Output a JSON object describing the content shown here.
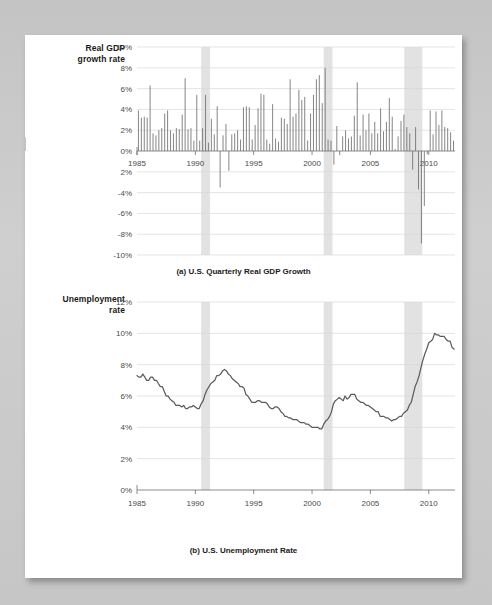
{
  "page": {
    "background_color": "#c9c9c9",
    "card_color": "#ffffff"
  },
  "figure_a": {
    "y_axis_label_line1": "Real GDP",
    "y_axis_label_line2": "growth rate",
    "caption": "(a) U.S. Quarterly Real GDP Growth"
  },
  "figure_b": {
    "y_axis_label_line1": "Unemployment",
    "y_axis_label_line2": "rate",
    "caption": "(b) U.S. Unemployment Rate"
  },
  "chart_data": [
    {
      "type": "bar",
      "title": "(a) U.S. Quarterly Real GDP Growth",
      "xlabel": "",
      "ylabel": "Real GDP growth rate",
      "xlim": [
        1985.0,
        2012.25
      ],
      "ylim": [
        -10,
        10
      ],
      "grid": true,
      "legend": "none",
      "bar_color": "#6f6f6f",
      "recession_band_color": "#e2e2e2",
      "y_ticks": [
        10,
        8,
        6,
        4,
        2,
        0,
        -2,
        -4,
        -6,
        -8,
        -10
      ],
      "y_tick_labels": [
        "10%",
        "8%",
        "6%",
        "4%",
        "2%",
        "0%",
        "2%",
        "-4%",
        "-6%",
        "-8%",
        "-10%"
      ],
      "x_ticks": [
        1985,
        1990,
        1995,
        2000,
        2005,
        2010
      ],
      "x_tick_labels": [
        "1985",
        "1990",
        "1995",
        "2000",
        "2005",
        "2010"
      ],
      "recessions": [
        {
          "start": 1990.5,
          "end": 1991.25
        },
        {
          "start": 2001.0,
          "end": 2001.75
        },
        {
          "start": 2007.9,
          "end": 2009.45
        }
      ],
      "x": [
        1985.0,
        1985.25,
        1985.5,
        1985.75,
        1986.0,
        1986.25,
        1986.5,
        1986.75,
        1987.0,
        1987.25,
        1987.5,
        1987.75,
        1988.0,
        1988.25,
        1988.5,
        1988.75,
        1989.0,
        1989.25,
        1989.5,
        1989.75,
        1990.0,
        1990.25,
        1990.5,
        1990.75,
        1991.0,
        1991.25,
        1991.5,
        1991.75,
        1992.0,
        1992.25,
        1992.5,
        1992.75,
        1993.0,
        1993.25,
        1993.5,
        1993.75,
        1994.0,
        1994.25,
        1994.5,
        1994.75,
        1995.0,
        1995.25,
        1995.5,
        1995.75,
        1996.0,
        1996.25,
        1996.5,
        1996.75,
        1997.0,
        1997.25,
        1997.5,
        1997.75,
        1998.0,
        1998.25,
        1998.5,
        1998.75,
        1999.0,
        1999.25,
        1999.5,
        1999.75,
        2000.0,
        2000.25,
        2000.5,
        2000.75,
        2001.0,
        2001.25,
        2001.5,
        2001.75,
        2002.0,
        2002.25,
        2002.5,
        2002.75,
        2003.0,
        2003.25,
        2003.5,
        2003.75,
        2004.0,
        2004.25,
        2004.5,
        2004.75,
        2005.0,
        2005.25,
        2005.5,
        2005.75,
        2006.0,
        2006.25,
        2006.5,
        2006.75,
        2007.0,
        2007.25,
        2007.5,
        2007.75,
        2008.0,
        2008.25,
        2008.5,
        2008.75,
        2009.0,
        2009.25,
        2009.5,
        2009.75,
        2010.0,
        2010.25,
        2010.5,
        2010.75,
        2011.0,
        2011.25,
        2011.5,
        2011.75,
        2012.0
      ],
      "values": [
        3.9,
        3.2,
        3.3,
        3.2,
        6.3,
        1.7,
        1.5,
        2.0,
        2.2,
        3.6,
        3.9,
        2.0,
        1.7,
        2.2,
        2.1,
        3.5,
        7.0,
        2.1,
        2.2,
        1.0,
        5.4,
        1.0,
        2.2,
        5.4,
        0.8,
        3.1,
        1.6,
        4.3,
        -3.5,
        1.5,
        2.6,
        -1.9,
        1.6,
        1.7,
        2.0,
        1.1,
        4.2,
        4.3,
        4.2,
        1.1,
        2.5,
        4.1,
        5.5,
        5.4,
        1.1,
        0.7,
        4.5,
        1.2,
        0.9,
        3.2,
        3.1,
        2.6,
        6.9,
        3.3,
        3.6,
        5.9,
        4.9,
        5.2,
        1.0,
        3.6,
        5.4,
        6.9,
        7.3,
        4.6,
        8.0,
        1.1,
        1.0,
        -1.3,
        2.4,
        -0.4,
        1.4,
        2.0,
        1.2,
        1.4,
        3.4,
        6.6,
        1.5,
        3.5,
        2.0,
        3.6,
        1.7,
        2.8,
        1.7,
        4.1,
        1.9,
        2.8,
        5.1,
        3.3,
        0.2,
        1.4,
        2.9,
        3.5,
        2.3,
        1.7,
        -1.8,
        2.3,
        -3.7,
        -8.9,
        -5.3,
        -0.3,
        3.9,
        1.6,
        3.8,
        2.5,
        3.9,
        2.3,
        2.2,
        1.8,
        1.0,
        1.3
      ]
    },
    {
      "type": "line",
      "title": "(b) U.S. Unemployment Rate",
      "xlabel": "",
      "ylabel": "Unemployment rate",
      "xlim": [
        1985.0,
        2012.25
      ],
      "ylim": [
        0,
        12
      ],
      "grid": true,
      "legend": "none",
      "line_color": "#5c5c5c",
      "recession_band_color": "#e2e2e2",
      "y_ticks": [
        12,
        10,
        8,
        6,
        4,
        2,
        0
      ],
      "y_tick_labels": [
        "12%",
        "10%",
        "8%",
        "6%",
        "4%",
        "2%",
        "0%"
      ],
      "x_ticks": [
        1985,
        1990,
        1995,
        2000,
        2005,
        2010
      ],
      "x_tick_labels": [
        "1985",
        "1990",
        "1995",
        "2000",
        "2005",
        "2010"
      ],
      "recessions": [
        {
          "start": 1990.5,
          "end": 1991.25
        },
        {
          "start": 2001.0,
          "end": 2001.75
        },
        {
          "start": 2007.9,
          "end": 2009.45
        }
      ],
      "x": [
        1985.0,
        1985.17,
        1985.33,
        1985.5,
        1985.67,
        1985.83,
        1986.0,
        1986.17,
        1986.33,
        1986.5,
        1986.67,
        1986.83,
        1987.0,
        1987.17,
        1987.33,
        1987.5,
        1987.67,
        1987.83,
        1988.0,
        1988.17,
        1988.33,
        1988.5,
        1988.67,
        1988.83,
        1989.0,
        1989.17,
        1989.33,
        1989.5,
        1989.67,
        1989.83,
        1990.0,
        1990.17,
        1990.33,
        1990.5,
        1990.67,
        1990.83,
        1991.0,
        1991.17,
        1991.33,
        1991.5,
        1991.67,
        1991.83,
        1992.0,
        1992.17,
        1992.33,
        1992.5,
        1992.67,
        1992.83,
        1993.0,
        1993.17,
        1993.33,
        1993.5,
        1993.67,
        1993.83,
        1994.0,
        1994.17,
        1994.33,
        1994.5,
        1994.67,
        1994.83,
        1995.0,
        1995.17,
        1995.33,
        1995.5,
        1995.67,
        1995.83,
        1996.0,
        1996.17,
        1996.33,
        1996.5,
        1996.67,
        1996.83,
        1997.0,
        1997.17,
        1997.33,
        1997.5,
        1997.67,
        1997.83,
        1998.0,
        1998.17,
        1998.33,
        1998.5,
        1998.67,
        1998.83,
        1999.0,
        1999.17,
        1999.33,
        1999.5,
        1999.67,
        1999.83,
        2000.0,
        2000.17,
        2000.33,
        2000.5,
        2000.67,
        2000.83,
        2001.0,
        2001.17,
        2001.33,
        2001.5,
        2001.67,
        2001.83,
        2002.0,
        2002.17,
        2002.33,
        2002.5,
        2002.67,
        2002.83,
        2003.0,
        2003.17,
        2003.33,
        2003.5,
        2003.67,
        2003.83,
        2004.0,
        2004.17,
        2004.33,
        2004.5,
        2004.67,
        2004.83,
        2005.0,
        2005.17,
        2005.33,
        2005.5,
        2005.67,
        2005.83,
        2006.0,
        2006.17,
        2006.33,
        2006.5,
        2006.67,
        2006.83,
        2007.0,
        2007.17,
        2007.33,
        2007.5,
        2007.67,
        2007.83,
        2008.0,
        2008.17,
        2008.33,
        2008.5,
        2008.67,
        2008.83,
        2009.0,
        2009.17,
        2009.33,
        2009.5,
        2009.67,
        2009.83,
        2010.0,
        2010.17,
        2010.33,
        2010.5,
        2010.67,
        2010.83,
        2011.0,
        2011.17,
        2011.33,
        2011.5,
        2011.67,
        2011.83,
        2012.0,
        2012.17
      ],
      "values": [
        7.3,
        7.2,
        7.2,
        7.4,
        7.2,
        7.0,
        7.0,
        7.2,
        7.2,
        7.0,
        7.0,
        6.8,
        6.6,
        6.6,
        6.3,
        6.0,
        6.0,
        5.8,
        5.7,
        5.6,
        5.4,
        5.4,
        5.4,
        5.3,
        5.4,
        5.2,
        5.2,
        5.3,
        5.3,
        5.4,
        5.3,
        5.2,
        5.2,
        5.5,
        5.7,
        6.1,
        6.4,
        6.6,
        6.8,
        6.9,
        7.0,
        7.3,
        7.3,
        7.4,
        7.6,
        7.7,
        7.6,
        7.4,
        7.3,
        7.1,
        7.0,
        6.9,
        6.8,
        6.6,
        6.6,
        6.5,
        6.1,
        6.0,
        5.8,
        5.6,
        5.6,
        5.6,
        5.7,
        5.7,
        5.6,
        5.6,
        5.6,
        5.5,
        5.3,
        5.2,
        5.2,
        5.3,
        5.3,
        5.2,
        5.0,
        4.9,
        4.7,
        4.7,
        4.6,
        4.6,
        4.5,
        4.5,
        4.5,
        4.4,
        4.3,
        4.3,
        4.3,
        4.2,
        4.2,
        4.1,
        4.0,
        4.0,
        4.0,
        4.0,
        3.9,
        3.9,
        4.2,
        4.4,
        4.5,
        4.7,
        5.0,
        5.5,
        5.7,
        5.8,
        5.9,
        5.8,
        5.7,
        6.0,
        5.8,
        5.9,
        6.1,
        6.1,
        6.1,
        5.8,
        5.7,
        5.6,
        5.6,
        5.5,
        5.4,
        5.4,
        5.3,
        5.2,
        5.1,
        5.0,
        5.0,
        4.7,
        4.7,
        4.7,
        4.6,
        4.6,
        4.5,
        4.4,
        4.5,
        4.5,
        4.6,
        4.7,
        4.7,
        4.9,
        5.0,
        5.1,
        5.4,
        5.6,
        6.1,
        6.6,
        6.9,
        7.3,
        7.8,
        8.3,
        8.7,
        9.0,
        9.4,
        9.5,
        9.6,
        10.0,
        9.9,
        9.9,
        9.8,
        9.8,
        9.8,
        9.6,
        9.5,
        9.5,
        9.1,
        9.0,
        9.1,
        9.1,
        9.0,
        8.9,
        8.7,
        8.5,
        8.3,
        8.2
      ]
    }
  ]
}
